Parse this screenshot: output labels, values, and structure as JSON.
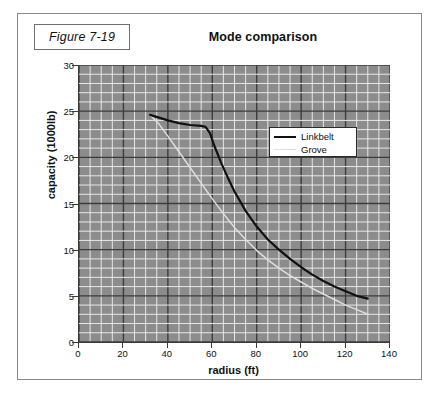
{
  "figure": {
    "label": "Figure 7-19",
    "title": "Mode comparison"
  },
  "legend": {
    "position": "inside-upper-right",
    "items": [
      {
        "label": "Linkbelt",
        "color": "#111111",
        "style": "thick-solid"
      },
      {
        "label": "Grove",
        "color": "#dedede",
        "style": "thin-solid"
      }
    ]
  },
  "axes": {
    "x": {
      "label": "radius (ft)",
      "ticks": [
        "0",
        "20",
        "40",
        "60",
        "80",
        "100",
        "120",
        "140"
      ],
      "min": 0,
      "max": 140,
      "minor_step": 5
    },
    "y": {
      "label": "capacity (1000lb)",
      "ticks": [
        "0",
        "5",
        "10",
        "15",
        "20",
        "25",
        "30"
      ],
      "min": 0,
      "max": 30,
      "minor_step": 1
    }
  },
  "colors": {
    "plot_background": "#8c8c8c",
    "minor_gridline": "#e8e8e8",
    "major_gridline": "#3c3c3c",
    "axis": "#3a3a3a",
    "frame": "#8a8a8a",
    "linkbelt": "#111111",
    "grove": "#dedede"
  },
  "chart_data": {
    "type": "line",
    "title": "Mode comparison",
    "xlabel": "radius (ft)",
    "ylabel": "capacity (1000lb)",
    "xlim": [
      0,
      140
    ],
    "ylim": [
      0,
      30
    ],
    "grid": true,
    "grid_minor_x": 5,
    "grid_minor_y": 1,
    "grid_major_x": 20,
    "grid_major_y": 5,
    "legend_position": "upper right inside",
    "series": [
      {
        "name": "Linkbelt",
        "color": "#111111",
        "points": [
          [
            32,
            24.6
          ],
          [
            36,
            24.3
          ],
          [
            40,
            24.0
          ],
          [
            45,
            23.7
          ],
          [
            50,
            23.5
          ],
          [
            55,
            23.4
          ],
          [
            57,
            23.3
          ],
          [
            59,
            22.6
          ],
          [
            61,
            21.2
          ],
          [
            64,
            19.4
          ],
          [
            67,
            17.8
          ],
          [
            70,
            16.3
          ],
          [
            75,
            14.2
          ],
          [
            80,
            12.5
          ],
          [
            85,
            11.1
          ],
          [
            90,
            10.0
          ],
          [
            95,
            9.0
          ],
          [
            100,
            8.1
          ],
          [
            105,
            7.3
          ],
          [
            110,
            6.6
          ],
          [
            115,
            6.0
          ],
          [
            120,
            5.5
          ],
          [
            125,
            5.0
          ],
          [
            130,
            4.7
          ]
        ]
      },
      {
        "name": "Grove",
        "color": "#dedede",
        "points": [
          [
            32,
            24.6
          ],
          [
            36,
            23.6
          ],
          [
            40,
            22.3
          ],
          [
            45,
            20.6
          ],
          [
            50,
            18.9
          ],
          [
            55,
            17.2
          ],
          [
            60,
            15.5
          ],
          [
            65,
            13.9
          ],
          [
            70,
            12.4
          ],
          [
            75,
            11.1
          ],
          [
            80,
            9.9
          ],
          [
            85,
            8.9
          ],
          [
            90,
            8.0
          ],
          [
            95,
            7.2
          ],
          [
            100,
            6.5
          ],
          [
            105,
            5.8
          ],
          [
            110,
            5.2
          ],
          [
            115,
            4.6
          ],
          [
            120,
            4.0
          ],
          [
            125,
            3.5
          ],
          [
            130,
            3.0
          ]
        ]
      }
    ]
  }
}
